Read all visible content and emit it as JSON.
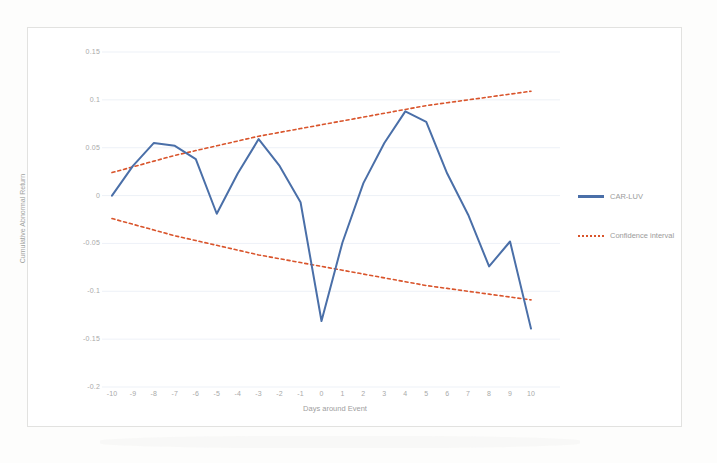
{
  "chart_data": {
    "type": "line",
    "title": "",
    "xlabel": "Days around Event",
    "ylabel": "Cumulative Abnormal Return",
    "x": [
      -10,
      -9,
      -8,
      -7,
      -6,
      -5,
      -4,
      -3,
      -2,
      -1,
      0,
      1,
      2,
      3,
      4,
      5,
      6,
      7,
      8,
      9,
      10
    ],
    "xticklabels": [
      "-10",
      "-9",
      "-8",
      "-7",
      "-6",
      "-5",
      "-4",
      "-3",
      "-2",
      "-1",
      "0",
      "1",
      "2",
      "3",
      "4",
      "5",
      "6",
      "7",
      "8",
      "9",
      "10"
    ],
    "yticklabels": [
      "0.15",
      "0.1",
      "0.05",
      "0",
      "-0.05",
      "-0.1",
      "-0.15",
      "-0.2"
    ],
    "yticks": [
      0.15,
      0.1,
      0.05,
      0,
      -0.05,
      -0.1,
      -0.15,
      -0.2
    ],
    "xlim": [
      -10,
      10
    ],
    "ylim": [
      -0.2,
      0.15
    ],
    "grid": true,
    "legend_position": "right",
    "series": [
      {
        "name": "CAR-LUV",
        "style": "solid",
        "color": "#4a6fa8",
        "values": [
          0.0,
          0.031,
          0.055,
          0.052,
          0.038,
          -0.019,
          0.023,
          0.059,
          0.031,
          -0.007,
          -0.131,
          -0.049,
          0.013,
          0.055,
          0.088,
          0.077,
          0.023,
          -0.02,
          -0.074,
          -0.048,
          -0.139
        ]
      },
      {
        "name": "Confidence interval",
        "style": "dotted",
        "color": "#d9542b",
        "bound": "upper",
        "values": [
          0.024,
          0.03,
          0.036,
          0.042,
          0.047,
          0.052,
          0.057,
          0.062,
          0.066,
          0.07,
          0.074,
          0.078,
          0.082,
          0.086,
          0.09,
          0.094,
          0.097,
          0.1,
          0.103,
          0.106,
          0.109
        ]
      },
      {
        "name": "Confidence interval",
        "style": "dotted",
        "color": "#d9542b",
        "bound": "lower",
        "values": [
          -0.024,
          -0.03,
          -0.036,
          -0.042,
          -0.047,
          -0.052,
          -0.057,
          -0.062,
          -0.066,
          -0.07,
          -0.074,
          -0.078,
          -0.082,
          -0.086,
          -0.09,
          -0.094,
          -0.097,
          -0.1,
          -0.103,
          -0.106,
          -0.109
        ]
      }
    ]
  },
  "legend": {
    "items": [
      {
        "label": "CAR-LUV",
        "marker": "solid-line-swatch"
      },
      {
        "label": "Confidence interval",
        "marker": "dotted-line-swatch"
      }
    ]
  },
  "axes": {
    "y_title": "Cumulative Abnormal Return",
    "x_title": "Days around Event"
  },
  "colors": {
    "series_line": "#4a6fa8",
    "confidence_band": "#d9542b",
    "gridline": "#e9eef5",
    "tick_text": "#a9a9a9",
    "frame": "#e2e2e0",
    "background": "#ffffff"
  }
}
